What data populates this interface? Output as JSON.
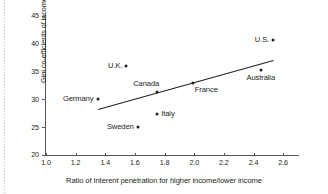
{
  "chart_data": {
    "type": "scatter",
    "title": "",
    "xlabel": "Ratio of Interent penetration for higher income/lower income",
    "ylabel": "Gini co-efficients of income",
    "xlim": [
      1.0,
      2.7
    ],
    "ylim": [
      20,
      45
    ],
    "xticks": [
      "1.0",
      "1.2",
      "1.4",
      "1.6",
      "1.8",
      "2.0",
      "2.2",
      "2.4",
      "2.6"
    ],
    "xtick_values": [
      1.0,
      1.2,
      1.4,
      1.6,
      1.8,
      2.0,
      2.2,
      2.4,
      2.6
    ],
    "yticks": [
      "20",
      "25",
      "30",
      "35",
      "40",
      "45"
    ],
    "ytick_values": [
      20,
      25,
      30,
      35,
      40,
      45
    ],
    "grid": false,
    "legend": "none",
    "marker_color": "#231f20",
    "axis_color": "#58595b",
    "points": [
      {
        "label": "Germany",
        "x": 1.35,
        "y": 30.0,
        "label_pos": "left"
      },
      {
        "label": "U.K.",
        "x": 1.54,
        "y": 36.0,
        "label_pos": "left"
      },
      {
        "label": "Sweden",
        "x": 1.62,
        "y": 25.0,
        "label_pos": "left"
      },
      {
        "label": "Canada",
        "x": 1.75,
        "y": 31.3,
        "label_pos": "above-left"
      },
      {
        "label": "Italy",
        "x": 1.75,
        "y": 27.3,
        "label_pos": "right"
      },
      {
        "label": "France",
        "x": 1.99,
        "y": 32.9,
        "label_pos": "below-right"
      },
      {
        "label": "Australia",
        "x": 2.45,
        "y": 35.2,
        "label_pos": "below"
      },
      {
        "label": "U.S.",
        "x": 2.53,
        "y": 40.6,
        "label_pos": "left"
      }
    ],
    "trendline": {
      "x0": 1.35,
      "y0": 28.3,
      "x1": 2.53,
      "y1": 37.1
    }
  }
}
